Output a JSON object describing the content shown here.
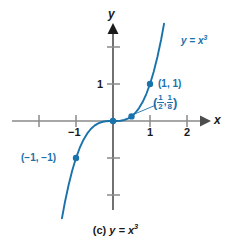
{
  "figure": {
    "caption_index": "(c)",
    "caption_function": "y = x",
    "caption_exponent": "3",
    "background_color": "#ffffff"
  },
  "axes": {
    "x_label": "x",
    "y_label": "y",
    "axis_color": "#808080",
    "x_ticks": [
      {
        "value": -2,
        "label": ""
      },
      {
        "value": -1,
        "label": "−1"
      },
      {
        "value": 1,
        "label": "1"
      },
      {
        "value": 2,
        "label": "2"
      }
    ],
    "y_ticks": [
      {
        "value": 2,
        "label": ""
      },
      {
        "value": 1,
        "label": "1"
      },
      {
        "value": -1,
        "label": ""
      },
      {
        "value": -2,
        "label": ""
      }
    ],
    "xlim": [
      -2.6,
      2.6
    ],
    "ylim": [
      -2.6,
      2.6
    ]
  },
  "curve": {
    "label_text": "y = x",
    "label_exponent": "3",
    "color": "#1a72ab",
    "equation": "y = x^3"
  },
  "chart_data": {
    "type": "line",
    "xlabel": "x",
    "ylabel": "y",
    "xlim": [
      -2.6,
      2.6
    ],
    "ylim": [
      -2.6,
      2.6
    ],
    "grid": false,
    "legend": "none",
    "series": [
      {
        "name": "y = x^3",
        "color": "#1a72ab",
        "x": [
          -1.38,
          -1.3,
          -1.2,
          -1.1,
          -1.0,
          -0.9,
          -0.8,
          -0.7,
          -0.6,
          -0.5,
          -0.4,
          -0.3,
          -0.2,
          -0.1,
          0.0,
          0.1,
          0.2,
          0.3,
          0.4,
          0.5,
          0.6,
          0.7,
          0.8,
          0.9,
          1.0,
          1.1,
          1.2,
          1.3,
          1.38
        ],
        "y": [
          -2.63,
          -2.197,
          -1.728,
          -1.331,
          -1.0,
          -0.729,
          -0.512,
          -0.343,
          -0.216,
          -0.125,
          -0.064,
          -0.027,
          -0.008,
          -0.001,
          0.0,
          0.001,
          0.008,
          0.027,
          0.064,
          0.125,
          0.216,
          0.343,
          0.512,
          0.729,
          1.0,
          1.331,
          1.728,
          2.197,
          2.63
        ]
      }
    ],
    "marked_points": [
      {
        "x": -1,
        "y": -1,
        "label": "(−1, −1)"
      },
      {
        "x": 0,
        "y": 0,
        "label": ""
      },
      {
        "x": 0.5,
        "y": 0.125,
        "label": "(1/2, 1/8)"
      },
      {
        "x": 1,
        "y": 1,
        "label": "(1, 1)"
      }
    ],
    "annotations": [
      {
        "text": "y = x³",
        "x": 1.45,
        "y": 2.35
      },
      {
        "text": "(1, 1)",
        "x": 1.2,
        "y": 1.0
      },
      {
        "text": "(1/2, 1/8)",
        "x": 1.05,
        "y": 0.62
      },
      {
        "text": "(−1, −1)",
        "x": -2.4,
        "y": -1.05
      }
    ]
  },
  "labels": {
    "point_1_1": "(1, 1)",
    "point_neg1_neg1": "(−1, −1)",
    "point_half_eighth": {
      "open_paren": "(",
      "num1": "1",
      "den1": "2",
      "comma": ",",
      "num2": "1",
      "den2": "8",
      "close_paren": ")"
    }
  }
}
